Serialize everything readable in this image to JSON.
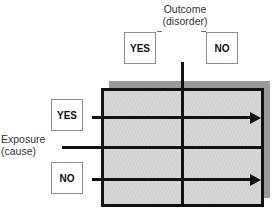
{
  "outcome": {
    "title_line1": "Outcome",
    "title_line2": "(disorder)",
    "yes_label": "YES",
    "no_label": "NO"
  },
  "exposure": {
    "title_line1": "Exposure",
    "title_line2": "(cause)",
    "yes_label": "YES",
    "no_label": "NO"
  },
  "colors": {
    "grid_fill": "#d4d4d4",
    "shadow": "#9a9a9a",
    "lines": "#111111"
  }
}
